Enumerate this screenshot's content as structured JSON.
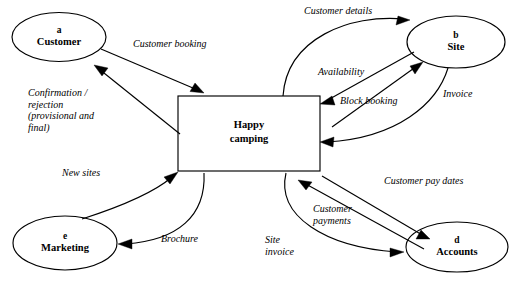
{
  "diagram": {
    "type": "data-flow-diagram",
    "process": {
      "id": "process-happy-camping",
      "line1": "Happy",
      "line2": "camping"
    },
    "entities": [
      {
        "id": "a",
        "key": "a",
        "name": "Customer"
      },
      {
        "id": "b",
        "key": "b",
        "name": "Site"
      },
      {
        "id": "d",
        "key": "d",
        "name": "Accounts"
      },
      {
        "id": "e",
        "key": "e",
        "name": "Marketing"
      }
    ],
    "flows": [
      {
        "id": "customer-booking",
        "label": "Customer booking",
        "from": "a",
        "to": "process"
      },
      {
        "id": "confirmation-rejection",
        "label": "Confirmation /\nrejection\n(provisional and\nfinal)",
        "from": "process",
        "to": "a"
      },
      {
        "id": "customer-details",
        "label": "Customer details",
        "from": "process",
        "to": "b"
      },
      {
        "id": "availability",
        "label": "Availability",
        "from": "b",
        "to": "process"
      },
      {
        "id": "block-booking",
        "label": "Block booking",
        "from": "process",
        "to": "b"
      },
      {
        "id": "invoice",
        "label": "Invoice",
        "from": "b",
        "to": "process"
      },
      {
        "id": "customer-pay-dates",
        "label": "Customer pay dates",
        "from": "process",
        "to": "d"
      },
      {
        "id": "customer-payments",
        "label": "Customer\npayments",
        "from": "d",
        "to": "process"
      },
      {
        "id": "site-invoice",
        "label": "Site\ninvoice",
        "from": "process",
        "to": "d"
      },
      {
        "id": "new-sites",
        "label": "New sites",
        "from": "e",
        "to": "process"
      },
      {
        "id": "brochure",
        "label": "Brochure",
        "from": "process",
        "to": "e"
      }
    ]
  }
}
